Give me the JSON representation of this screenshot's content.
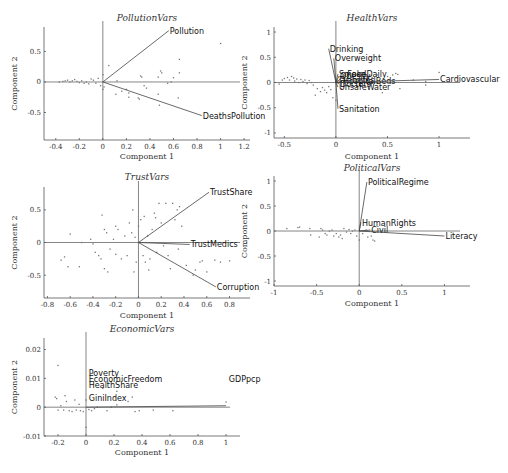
{
  "chart_data": [
    {
      "type": "scatter",
      "title": "PollutionVars",
      "xlabel": "Component 1",
      "ylabel": "Component 2",
      "xlim": [
        -0.5,
        1.25
      ],
      "ylim": [
        -0.95,
        0.9
      ],
      "xticks": [
        -0.4,
        -0.2,
        0,
        0.2,
        0.4,
        0.6,
        0.8,
        1,
        1.2
      ],
      "xtick_labels": [
        "-0.4",
        "-0.2",
        "0",
        "0.2",
        "0.4",
        "0.6",
        "0.8",
        "1",
        "1.2"
      ],
      "yticks": [
        -0.5,
        0,
        0.5
      ],
      "ytick_labels": [
        "-0.5",
        "0",
        "0.5"
      ],
      "vectors": [
        {
          "name": "Pollution",
          "x": 0.56,
          "y": 0.84
        },
        {
          "name": "DeathsPollution",
          "x": 0.84,
          "y": -0.55
        }
      ],
      "points": [
        [
          -0.37,
          0.0
        ],
        [
          -0.34,
          0.01
        ],
        [
          -0.32,
          0.02
        ],
        [
          -0.3,
          0.03
        ],
        [
          -0.28,
          0.0
        ],
        [
          -0.26,
          0.02
        ],
        [
          -0.24,
          0.04
        ],
        [
          -0.22,
          0.01
        ],
        [
          -0.2,
          -0.01
        ],
        [
          -0.18,
          0.02
        ],
        [
          -0.16,
          -0.02
        ],
        [
          -0.14,
          0.0
        ],
        [
          -0.12,
          -0.03
        ],
        [
          -0.1,
          0.05
        ],
        [
          -0.08,
          0.03
        ],
        [
          -0.06,
          -0.02
        ],
        [
          -0.04,
          0.06
        ],
        [
          -0.02,
          -0.06
        ],
        [
          0.0,
          0.12
        ],
        [
          0.01,
          -0.08
        ],
        [
          0.0,
          -0.12
        ],
        [
          0.05,
          0.27
        ],
        [
          0.11,
          -0.2
        ],
        [
          0.12,
          0.02
        ],
        [
          0.16,
          -0.15
        ],
        [
          0.2,
          -0.12
        ],
        [
          0.22,
          -0.25
        ],
        [
          0.22,
          -0.18
        ],
        [
          0.3,
          -0.26
        ],
        [
          0.31,
          -0.28
        ],
        [
          0.32,
          0.1
        ],
        [
          0.33,
          0.08
        ],
        [
          0.35,
          -0.06
        ],
        [
          0.37,
          -0.1
        ],
        [
          0.47,
          -0.2
        ],
        [
          0.47,
          0.08
        ],
        [
          0.48,
          -0.38
        ],
        [
          0.49,
          0.18
        ],
        [
          0.5,
          0.15
        ],
        [
          0.55,
          -0.02
        ],
        [
          0.58,
          0.0
        ],
        [
          0.6,
          0.07
        ],
        [
          0.64,
          -0.26
        ],
        [
          0.65,
          0.37
        ],
        [
          0.65,
          0.15
        ],
        [
          1.0,
          0.63
        ]
      ]
    },
    {
      "type": "scatter",
      "title": "HealthVars",
      "xlabel": "Component 1",
      "ylabel": "Component 2",
      "xlim": [
        -0.6,
        1.3
      ],
      "ylim": [
        -1.1,
        1.1
      ],
      "xticks": [
        -0.5,
        0,
        0.5,
        1
      ],
      "xtick_labels": [
        "-0.5",
        "0",
        "0.5",
        "1"
      ],
      "yticks": [
        -1,
        -0.5,
        0,
        0.5,
        1
      ],
      "ytick_labels": [
        "-1",
        "-0.5",
        "0",
        "0.5",
        "1"
      ],
      "vectors": [
        {
          "name": "Drinking",
          "x": -0.07,
          "y": 0.67
        },
        {
          "name": "Overweight",
          "x": -0.02,
          "y": 0.48
        },
        {
          "name": "Smoke",
          "x": 0.02,
          "y": 0.17
        },
        {
          "name": "Obesity",
          "x": 0.03,
          "y": 0.13
        },
        {
          "name": "FoodDaily",
          "x": 0.1,
          "y": 0.16
        },
        {
          "name": "Diabetes",
          "x": 0.02,
          "y": 0.04
        },
        {
          "name": "HospitalBeds",
          "x": 0.06,
          "y": 0.02
        },
        {
          "name": "Doctors",
          "x": 0.03,
          "y": -0.02
        },
        {
          "name": "UnsafeWater",
          "x": 0.02,
          "y": -0.09
        },
        {
          "name": "Sanitation",
          "x": 0.02,
          "y": -0.52
        },
        {
          "name": "Cardiovascular",
          "x": 1.0,
          "y": 0.06
        }
      ],
      "overlapping_labels_text": [
        "SmokeFoodDaily",
        "DiseasesBeds",
        "UnsafeWater"
      ],
      "points": [
        [
          -0.55,
          -0.03
        ],
        [
          -0.52,
          0.05
        ],
        [
          -0.5,
          0.08
        ],
        [
          -0.47,
          0.1
        ],
        [
          -0.45,
          0.05
        ],
        [
          -0.43,
          0.12
        ],
        [
          -0.41,
          0.09
        ],
        [
          -0.4,
          0.03
        ],
        [
          -0.38,
          0.07
        ],
        [
          -0.36,
          0.0
        ],
        [
          -0.34,
          0.06
        ],
        [
          -0.32,
          0.02
        ],
        [
          -0.3,
          0.05
        ],
        [
          -0.28,
          -0.02
        ],
        [
          -0.26,
          0.04
        ],
        [
          -0.24,
          0.0
        ],
        [
          -0.22,
          -0.05
        ],
        [
          -0.2,
          -0.25
        ],
        [
          -0.18,
          -0.12
        ],
        [
          -0.15,
          -0.18
        ],
        [
          -0.13,
          -0.1
        ],
        [
          -0.11,
          -0.15
        ],
        [
          -0.09,
          -0.2
        ],
        [
          -0.07,
          -0.08
        ],
        [
          -0.05,
          -0.14
        ],
        [
          -0.03,
          -0.3
        ],
        [
          0.0,
          -0.35
        ],
        [
          0.05,
          -0.12
        ],
        [
          0.1,
          -0.05
        ],
        [
          0.15,
          0.1
        ],
        [
          0.2,
          -0.08
        ],
        [
          0.25,
          0.08
        ],
        [
          0.3,
          0.12
        ],
        [
          0.35,
          0.1
        ],
        [
          0.4,
          0.15
        ],
        [
          0.45,
          -0.2
        ],
        [
          0.5,
          0.12
        ],
        [
          0.55,
          0.15
        ],
        [
          0.58,
          0.18
        ],
        [
          0.6,
          0.16
        ],
        [
          0.62,
          -0.12
        ],
        [
          0.75,
          0.05
        ],
        [
          0.87,
          0.02
        ],
        [
          0.87,
          -0.05
        ],
        [
          1.0,
          0.2
        ]
      ]
    },
    {
      "type": "scatter",
      "title": "TrustVars",
      "xlabel": "Component 1",
      "ylabel": "Component 2",
      "xlim": [
        -0.83,
        0.98
      ],
      "ylim": [
        -0.85,
        0.85
      ],
      "xticks": [
        -0.8,
        -0.6,
        -0.4,
        -0.2,
        0,
        0.2,
        0.4,
        0.6,
        0.8
      ],
      "xtick_labels": [
        "-0.8",
        "-0.6",
        "-0.4",
        "-0.2",
        "0",
        "0.2",
        "0.4",
        "0.6",
        "0.8"
      ],
      "yticks": [
        -0.5,
        0,
        0.5
      ],
      "ytick_labels": [
        "-0.5",
        "0",
        "0.5"
      ],
      "vectors": [
        {
          "name": "TrustShare",
          "x": 0.62,
          "y": 0.77
        },
        {
          "name": "TrustMedics",
          "x": 0.45,
          "y": -0.03
        },
        {
          "name": "Corruption",
          "x": 0.68,
          "y": -0.68
        }
      ],
      "points": [
        [
          -0.68,
          -0.27
        ],
        [
          -0.65,
          -0.22
        ],
        [
          -0.62,
          -0.37
        ],
        [
          -0.6,
          0.13
        ],
        [
          -0.52,
          -0.37
        ],
        [
          -0.5,
          0.0
        ],
        [
          -0.42,
          0.05
        ],
        [
          -0.4,
          -0.02
        ],
        [
          -0.38,
          -0.15
        ],
        [
          -0.35,
          -0.2
        ],
        [
          -0.33,
          -0.25
        ],
        [
          -0.32,
          0.42
        ],
        [
          -0.3,
          -0.4
        ],
        [
          -0.3,
          0.2
        ],
        [
          -0.28,
          0.15
        ],
        [
          -0.27,
          -0.45
        ],
        [
          -0.25,
          -0.1
        ],
        [
          -0.22,
          0.05
        ],
        [
          -0.2,
          -0.18
        ],
        [
          -0.2,
          0.25
        ],
        [
          -0.18,
          0.2
        ],
        [
          -0.15,
          -0.25
        ],
        [
          -0.12,
          0.1
        ],
        [
          -0.1,
          -0.2
        ],
        [
          -0.08,
          0.3
        ],
        [
          -0.06,
          0.15
        ],
        [
          -0.05,
          0.5
        ],
        [
          -0.04,
          -0.45
        ],
        [
          -0.03,
          0.08
        ],
        [
          -0.02,
          -0.3
        ],
        [
          0.0,
          0.25
        ],
        [
          0.02,
          0.35
        ],
        [
          0.04,
          -0.2
        ],
        [
          0.05,
          0.4
        ],
        [
          0.06,
          -0.3
        ],
        [
          0.08,
          0.1
        ],
        [
          0.09,
          -0.42
        ],
        [
          0.1,
          -0.25
        ],
        [
          0.12,
          0.2
        ],
        [
          0.14,
          0.45
        ],
        [
          0.15,
          0.38
        ],
        [
          0.16,
          -0.15
        ],
        [
          0.18,
          0.6
        ],
        [
          0.2,
          0.3
        ],
        [
          0.22,
          -0.05
        ],
        [
          0.24,
          0.6
        ],
        [
          0.26,
          -0.2
        ],
        [
          0.28,
          -0.4
        ],
        [
          0.3,
          0.6
        ],
        [
          0.32,
          0.35
        ],
        [
          0.34,
          0.5
        ],
        [
          0.35,
          -0.1
        ],
        [
          0.36,
          0.55
        ],
        [
          0.38,
          0.25
        ],
        [
          0.42,
          -0.35
        ],
        [
          0.48,
          -0.5
        ],
        [
          0.5,
          -0.42
        ],
        [
          0.54,
          -0.3
        ],
        [
          0.56,
          -0.28
        ],
        [
          0.6,
          -0.45
        ],
        [
          0.67,
          -0.27
        ],
        [
          0.72,
          -0.3
        ],
        [
          0.8,
          -0.28
        ],
        [
          0.95,
          0.0
        ]
      ]
    },
    {
      "type": "scatter",
      "title": "PoliticalVars",
      "xlabel": "Component 1",
      "ylabel": "Component 2",
      "xlim": [
        -1.0,
        1.3
      ],
      "ylim": [
        -1.1,
        1.1
      ],
      "xticks": [
        -1,
        -0.5,
        0,
        0.5,
        1
      ],
      "xtick_labels": [
        "-1",
        "-0.5",
        "0",
        "0.5",
        "1"
      ],
      "yticks": [
        -1,
        -0.5,
        0,
        0.5,
        1
      ],
      "ytick_labels": [
        "-1",
        "-0.5",
        "0",
        "0.5",
        "1"
      ],
      "vectors": [
        {
          "name": "PoliticalRegime",
          "x": 0.09,
          "y": 0.98
        },
        {
          "name": "HumanRights",
          "x": 0.02,
          "y": 0.17
        },
        {
          "name": "Civil",
          "x": 0.13,
          "y": 0.02
        },
        {
          "name": "Literacy",
          "x": 1.0,
          "y": -0.1
        }
      ],
      "overlapping_labels_text": [
        "CL"
      ],
      "points": [
        [
          -0.85,
          0.05
        ],
        [
          -0.72,
          0.07
        ],
        [
          -0.7,
          0.08
        ],
        [
          -0.58,
          0.05
        ],
        [
          -0.57,
          -0.08
        ],
        [
          -0.47,
          -0.12
        ],
        [
          -0.45,
          0.05
        ],
        [
          -0.43,
          0.02
        ],
        [
          -0.4,
          -0.05
        ],
        [
          -0.38,
          -0.08
        ],
        [
          -0.35,
          0.0
        ],
        [
          -0.32,
          0.02
        ],
        [
          -0.3,
          -0.1
        ],
        [
          -0.27,
          -0.05
        ],
        [
          -0.24,
          -0.12
        ],
        [
          -0.22,
          -0.08
        ],
        [
          -0.2,
          -0.15
        ],
        [
          -0.18,
          0.05
        ],
        [
          -0.15,
          -0.02
        ],
        [
          -0.12,
          0.03
        ],
        [
          -0.1,
          -0.05
        ],
        [
          -0.08,
          0.0
        ],
        [
          -0.05,
          0.02
        ],
        [
          -0.03,
          -0.1
        ],
        [
          0.0,
          -0.18
        ],
        [
          0.04,
          -0.05
        ],
        [
          0.08,
          0.02
        ],
        [
          0.1,
          -0.12
        ],
        [
          0.14,
          -0.1
        ],
        [
          0.16,
          -0.18
        ],
        [
          0.18,
          -0.2
        ]
      ]
    },
    {
      "type": "scatter",
      "title": "EconomicVars",
      "xlabel": "Component 1",
      "ylabel": "Component 2",
      "xlim": [
        -0.3,
        1.1
      ],
      "ylim": [
        -0.01,
        0.024
      ],
      "xticks": [
        -0.2,
        0,
        0.2,
        0.4,
        0.6,
        0.8,
        1
      ],
      "xtick_labels": [
        "-0.2",
        "0",
        "0.2",
        "0.4",
        "0.6",
        "0.8",
        "1"
      ],
      "yticks": [
        -0.01,
        0,
        0.01,
        0.02
      ],
      "ytick_labels": [
        "-0.01",
        "0",
        "0.01",
        "0.02"
      ],
      "vectors": [
        {
          "name": "GDPpcp",
          "x": 1.0,
          "y": 0.0005
        },
        {
          "name": "Poverty",
          "x": 0.0,
          "y": 0.0
        },
        {
          "name": "EconomicFreedom",
          "x": 0.0,
          "y": 0.0
        },
        {
          "name": "HealthShare",
          "x": 0.0,
          "y": 0.0
        },
        {
          "name": "GiniIndex",
          "x": 0.0,
          "y": 0.0
        }
      ],
      "label_positions_text": [
        {
          "name": "Poverty",
          "x": 0.02,
          "y": 0.012
        },
        {
          "name": "EconomicFreedom",
          "x": 0.02,
          "y": 0.0098
        },
        {
          "name": "HealthShare",
          "x": 0.02,
          "y": 0.0078
        },
        {
          "name": "GiniIndex",
          "x": 0.02,
          "y": 0.0033
        },
        {
          "name": "GDPpcp",
          "x": 1.02,
          "y": 0.0098
        }
      ],
      "points": [
        [
          -0.22,
          0.0035
        ],
        [
          -0.21,
          0.003
        ],
        [
          -0.2,
          0.0145
        ],
        [
          -0.2,
          -0.001
        ],
        [
          -0.18,
          0.0005
        ],
        [
          -0.16,
          -0.001
        ],
        [
          -0.15,
          0.004
        ],
        [
          -0.14,
          0.002
        ],
        [
          -0.12,
          -0.0012
        ],
        [
          -0.1,
          -0.0015
        ],
        [
          -0.08,
          0.0025
        ],
        [
          -0.07,
          -0.001
        ],
        [
          -0.05,
          0.001
        ],
        [
          -0.04,
          -0.0012
        ],
        [
          -0.02,
          -0.0015
        ],
        [
          0.0,
          0.0025
        ],
        [
          0.0,
          -0.007
        ],
        [
          0.02,
          -0.0008
        ],
        [
          0.04,
          -0.0012
        ],
        [
          0.06,
          -0.0005
        ],
        [
          0.08,
          0.0
        ],
        [
          0.12,
          0.0065
        ],
        [
          0.15,
          -0.0012
        ],
        [
          0.18,
          0.0
        ],
        [
          0.22,
          0.0055
        ],
        [
          0.22,
          0.0008
        ],
        [
          0.3,
          0.002
        ],
        [
          0.33,
          0.0035
        ],
        [
          0.35,
          -0.0015
        ],
        [
          0.38,
          -0.0012
        ],
        [
          0.48,
          -0.001
        ],
        [
          0.62,
          -0.0012
        ],
        [
          1.0,
          0.0018
        ]
      ]
    }
  ]
}
